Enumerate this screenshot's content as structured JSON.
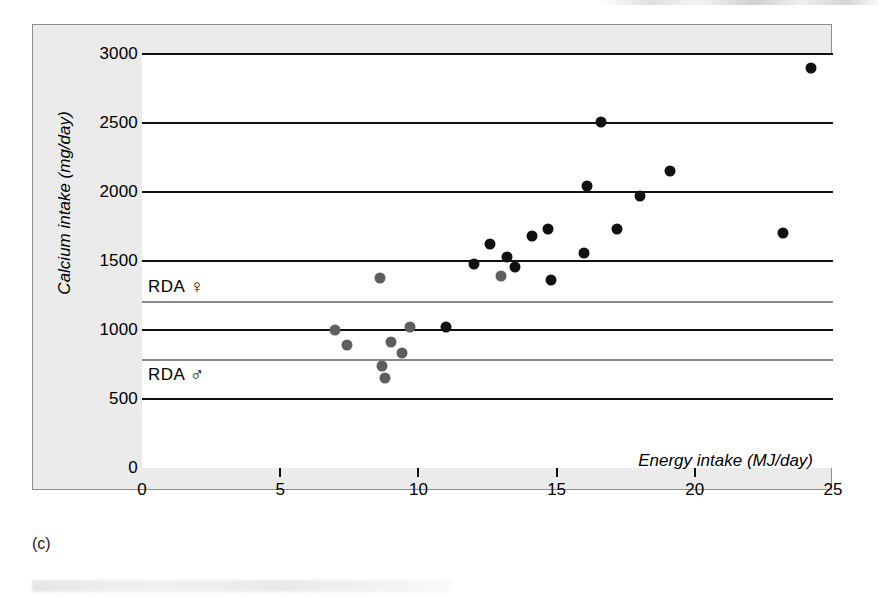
{
  "figure": {
    "caption": "(c)"
  },
  "chart_data": {
    "type": "scatter",
    "title": "",
    "xlabel": "Energy intake (MJ/day)",
    "ylabel": "Calcium intake (mg/day)",
    "xlim": [
      0,
      25
    ],
    "ylim": [
      0,
      3000
    ],
    "xticks": [
      0,
      5,
      10,
      15,
      20,
      25
    ],
    "xticklabels": [
      "0",
      "5",
      "10",
      "15",
      "20",
      "25"
    ],
    "yticks": [
      0,
      500,
      1000,
      1500,
      2000,
      2500,
      3000
    ],
    "yticklabels": [
      "0",
      "500",
      "1000",
      "1500",
      "2000",
      "2500",
      "3000"
    ],
    "grid": "horizontal gridlines at every labelled y tick (except 0), drawn across full plot width",
    "legend": "none",
    "annotations": [
      {
        "text": "RDA",
        "symbol": "♀",
        "symbol_name": "female-symbol",
        "value": 1200,
        "label": "RDA ♀"
      },
      {
        "text": "RDA",
        "symbol": "♂",
        "symbol_name": "male-symbol",
        "value": 780,
        "label": "RDA ♂"
      }
    ],
    "reference_lines": [
      {
        "name": "rda-female-line",
        "y": 1200,
        "color": "#8a8a8a"
      },
      {
        "name": "rda-male-line",
        "y": 780,
        "color": "#8a8a8a"
      }
    ],
    "series": [
      {
        "name": "Men",
        "color": "#111111",
        "points": [
          {
            "x": 11.0,
            "y": 1020
          },
          {
            "x": 12.0,
            "y": 1480
          },
          {
            "x": 12.6,
            "y": 1620
          },
          {
            "x": 13.2,
            "y": 1530
          },
          {
            "x": 13.5,
            "y": 1460
          },
          {
            "x": 14.1,
            "y": 1680
          },
          {
            "x": 14.7,
            "y": 1730
          },
          {
            "x": 14.8,
            "y": 1360
          },
          {
            "x": 16.0,
            "y": 1560
          },
          {
            "x": 16.1,
            "y": 2040
          },
          {
            "x": 16.6,
            "y": 2510
          },
          {
            "x": 17.2,
            "y": 1730
          },
          {
            "x": 18.0,
            "y": 1970
          },
          {
            "x": 19.1,
            "y": 2150
          },
          {
            "x": 23.2,
            "y": 1700
          },
          {
            "x": 24.2,
            "y": 2900
          }
        ]
      },
      {
        "name": "Women",
        "color": "#5e5e5e",
        "points": [
          {
            "x": 7.0,
            "y": 1000
          },
          {
            "x": 7.4,
            "y": 890
          },
          {
            "x": 8.6,
            "y": 1380
          },
          {
            "x": 8.7,
            "y": 740
          },
          {
            "x": 8.8,
            "y": 650
          },
          {
            "x": 9.0,
            "y": 910
          },
          {
            "x": 9.4,
            "y": 830
          },
          {
            "x": 9.7,
            "y": 1020
          },
          {
            "x": 13.0,
            "y": 1390
          }
        ]
      }
    ]
  }
}
